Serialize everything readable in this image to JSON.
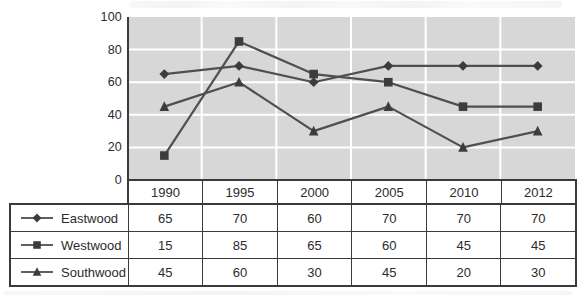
{
  "chart_data": {
    "type": "line",
    "title": "",
    "xlabel": "",
    "ylabel": "",
    "categories": [
      "1990",
      "1995",
      "2000",
      "2005",
      "2010",
      "2012"
    ],
    "series": [
      {
        "name": "Eastwood",
        "marker": "diamond",
        "values": [
          65,
          70,
          60,
          70,
          70,
          70
        ]
      },
      {
        "name": "Westwood",
        "marker": "square",
        "values": [
          15,
          85,
          65,
          60,
          45,
          45
        ]
      },
      {
        "name": "Southwood",
        "marker": "triangle",
        "values": [
          45,
          60,
          30,
          45,
          20,
          30
        ]
      }
    ],
    "ylim": [
      0,
      100
    ],
    "ytick_step": 20,
    "ytick_labels": [
      "100",
      "80",
      "60",
      "40",
      "20",
      "0"
    ],
    "grid": true,
    "legend_position": "table-left"
  },
  "colors": {
    "plot_bg": "#d7d7d7",
    "gridline": "#ffffff",
    "line": "#4f4f4f",
    "marker": "#3c3c3c",
    "axis": "#3a3a3a",
    "table_border": "#3a3a3a",
    "text": "#2b2b2b"
  }
}
